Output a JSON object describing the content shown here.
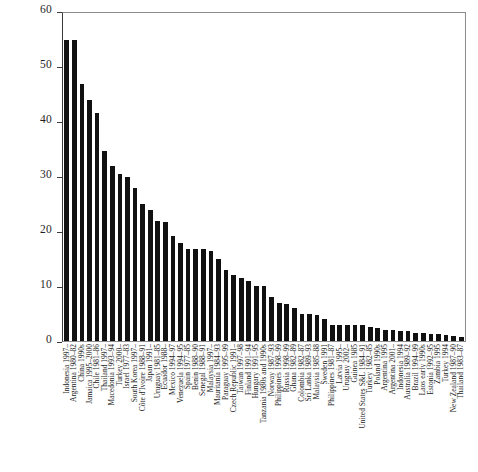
{
  "chart_data": {
    "type": "bar",
    "title": "",
    "subtitle": "",
    "xlabel": "",
    "ylabel": "",
    "ylim": [
      0,
      60
    ],
    "yticks": [
      0,
      10,
      20,
      30,
      40,
      50,
      60
    ],
    "ytick_labels": [
      "0",
      "10",
      "20",
      "30",
      "40",
      "50",
      "60"
    ],
    "grid": false,
    "legend": null,
    "bar_color": "#111111",
    "orientation": "vertical",
    "categories": [
      "Indonesia 1997–",
      "Argentina 1980–82",
      "China 1990s",
      "Jamaica 1995–2000",
      "Chile 1981–86",
      "Thailand 1997–",
      "Macedonia 1993–94",
      "Turkey 2000–",
      "Israel 1977–83",
      "South Korea 1997–",
      "Côte d'Ivoire 1988–91",
      "Japan 1991–",
      "Uruguay 1981–85",
      "Ecuador 1988–",
      "Mexico 1994–97",
      "Venezuela 1994–95",
      "Spain 1977–85",
      "Benin 1988–90",
      "Senegal 1988–91",
      "Malaysia 1997–",
      "Mauritania 1984–93",
      "Paraguay 1995–99",
      "Czech Republic 1991–",
      "Taiwan 1997–98",
      "Finland 1991–94",
      "Hungary 1991–95",
      "Tanzania 1980s and 1990s",
      "Norway 1987–93",
      "Philippines 1998–99",
      "Russia 1998–99",
      "Ghana 1982–89",
      "Colombia 1982–87",
      "Sri Lanka 1989–93",
      "Malaysia 1985–88",
      "Sweden 1991",
      "Philippines 1981–87",
      "Latvia 1995–",
      "Uruguay 2002–",
      "Guinea 1985",
      "United States S&L 1984–91",
      "Turkey 1982–85",
      "Poland 1990s",
      "Argentina 1995",
      "Argentina 2001–",
      "Indonesia 1994",
      "Australia 1989–92",
      "Brazil 1994–99",
      "Laos early 1990s",
      "Estonia 1992–95",
      "Zambia 1995",
      "Turkey 1994",
      "New Zealand 1987–90",
      "Thailand 1983–87"
    ],
    "values": [
      55.0,
      55.1,
      47.0,
      44.0,
      41.8,
      34.8,
      32.0,
      30.5,
      30.0,
      28.0,
      25.0,
      24.0,
      22.0,
      21.7,
      19.3,
      18.0,
      16.8,
      16.8,
      16.8,
      16.4,
      15.0,
      13.0,
      12.0,
      11.5,
      11.0,
      10.0,
      10.0,
      8.0,
      7.0,
      6.8,
      6.0,
      5.0,
      5.0,
      4.7,
      4.0,
      3.0,
      3.0,
      3.0,
      3.0,
      3.0,
      2.5,
      2.3,
      2.0,
      2.0,
      1.8,
      1.8,
      1.4,
      1.4,
      1.3,
      1.3,
      1.1,
      1.0,
      0.8
    ],
    "series": [
      {
        "name": "Fiscal cost of banking crisis",
        "values": [
          55.0,
          55.1,
          47.0,
          44.0,
          41.8,
          34.8,
          32.0,
          30.5,
          30.0,
          28.0,
          25.0,
          24.0,
          22.0,
          21.7,
          19.3,
          18.0,
          16.8,
          16.8,
          16.8,
          16.4,
          15.0,
          13.0,
          12.0,
          11.5,
          11.0,
          10.0,
          10.0,
          8.0,
          7.0,
          6.8,
          6.0,
          5.0,
          5.0,
          4.7,
          4.0,
          3.0,
          3.0,
          3.0,
          3.0,
          3.0,
          2.5,
          2.3,
          2.0,
          2.0,
          1.8,
          1.8,
          1.4,
          1.4,
          1.3,
          1.3,
          1.1,
          1.0,
          0.8
        ]
      }
    ]
  }
}
